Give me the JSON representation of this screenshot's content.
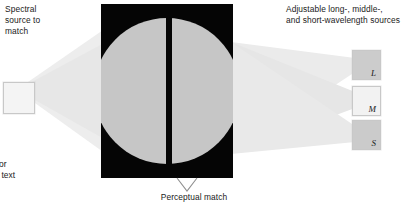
{
  "figure": {
    "width": 419,
    "height": 210,
    "background_color": "#ffffff"
  },
  "left_source": {
    "label": "Spectral\nsource to\nmatch",
    "box": {
      "name": "spectral-source-box",
      "fill_color": "#f4f4f4",
      "border_color": "#c8c8c8"
    },
    "beam": {
      "name": "spectral-source-beam",
      "color": "#ebebeb"
    }
  },
  "right_sources": {
    "label": "Adjustable long-, middle-,\nand short-wavelength sources",
    "boxes": [
      {
        "id": "L",
        "label": "L",
        "fill_color": "#cccccc",
        "border_color": "#c8c8c8"
      },
      {
        "id": "M",
        "label": "M",
        "fill_color": "#f2f2f2",
        "border_color": "#c8c8c8"
      },
      {
        "id": "S",
        "label": "S",
        "fill_color": "#cbcbcb",
        "border_color": "#c8c8c8"
      }
    ],
    "beams": {
      "name": "adjustable-source-beams",
      "color": "#e4e4e4"
    }
  },
  "viewing_panel": {
    "name": "viewing-panel",
    "background_color": "#050505",
    "circle": {
      "name": "match-circle",
      "fill_color": "#c6c6c6"
    },
    "divider": {
      "name": "field-divider",
      "color": "#050505"
    }
  },
  "pointer": {
    "name": "perceptual-match-pointer",
    "shape": "chevron-down",
    "stroke_color": "#8c8c8c"
  },
  "annotations": {
    "perceptual_match": "Perceptual match",
    "figure_caption": "cal setup for\nents. (See text"
  }
}
